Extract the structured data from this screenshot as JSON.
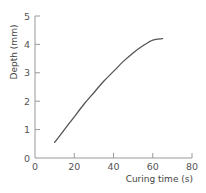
{
  "chart_data": {
    "type": "line",
    "title": "",
    "xlabel": "Curing time (s)",
    "ylabel": "Depth (mm)",
    "xlim": [
      0,
      80
    ],
    "ylim": [
      0,
      5
    ],
    "xticks": [
      0,
      20,
      40,
      60,
      80
    ],
    "yticks": [
      0,
      1,
      2,
      3,
      4,
      5
    ],
    "grid": false,
    "legend": null,
    "series": [
      {
        "name": "Depth",
        "color": "#555555",
        "x": [
          10,
          15,
          20,
          25,
          30,
          35,
          40,
          45,
          50,
          55,
          60,
          65
        ],
        "y": [
          0.55,
          1.0,
          1.45,
          1.9,
          2.3,
          2.7,
          3.05,
          3.4,
          3.7,
          3.95,
          4.15,
          4.2
        ]
      }
    ]
  },
  "colors": {
    "axis": "#999999",
    "line": "#555555",
    "text": "#555555"
  }
}
